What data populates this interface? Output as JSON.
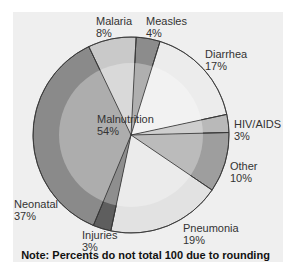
{
  "chart_data": {
    "type": "pie",
    "title": "",
    "categories": [
      "Malaria",
      "Measles",
      "Diarrhea",
      "HIV/AIDS",
      "Other",
      "Pneumonia",
      "Injuries",
      "Neonatal"
    ],
    "values": [
      8,
      4,
      17,
      3,
      10,
      19,
      3,
      37
    ],
    "overlay": {
      "label": "Malnutrition",
      "value": 54,
      "note": "Inner ring overlapping all segments"
    },
    "slices": [
      {
        "label": "Malaria",
        "percent": "8%",
        "value": 8,
        "color": "#c9c9c9"
      },
      {
        "label": "Measles",
        "percent": "4%",
        "value": 4,
        "color": "#8c8c8c"
      },
      {
        "label": "Diarrhea",
        "percent": "17%",
        "value": 17,
        "color": "#ececec"
      },
      {
        "label": "HIV/AIDS",
        "percent": "3%",
        "value": 3,
        "color": "#b9b9b9"
      },
      {
        "label": "Other",
        "percent": "10%",
        "value": 10,
        "color": "#9e9e9e"
      },
      {
        "label": "Pneumonia",
        "percent": "19%",
        "value": 19,
        "color": "#e2e2e2"
      },
      {
        "label": "Injuries",
        "percent": "3%",
        "value": 3,
        "color": "#5e5e5e"
      },
      {
        "label": "Neonatal",
        "percent": "37%",
        "value": 37,
        "color": "#8a8a8a"
      }
    ],
    "legend": "none (direct labels)",
    "footnote": "Note: Percents do not total 100 due to rounding"
  },
  "labels": {
    "malaria": {
      "name": "Malaria",
      "pct": "8%"
    },
    "measles": {
      "name": "Measles",
      "pct": "4%"
    },
    "diarrhea": {
      "name": "Diarrhea",
      "pct": "17%"
    },
    "hiv": {
      "name": "HIV/AIDS",
      "pct": "3%"
    },
    "other": {
      "name": "Other",
      "pct": "10%"
    },
    "pneumonia": {
      "name": "Pneumonia",
      "pct": "19%"
    },
    "injuries": {
      "name": "Injuries",
      "pct": "3%"
    },
    "neonatal": {
      "name": "Neonatal",
      "pct": "37%"
    },
    "malnutrition": {
      "name": "Malnutrition",
      "pct": "54%"
    }
  },
  "footnote": "Note: Percents do not total 100 due to rounding"
}
